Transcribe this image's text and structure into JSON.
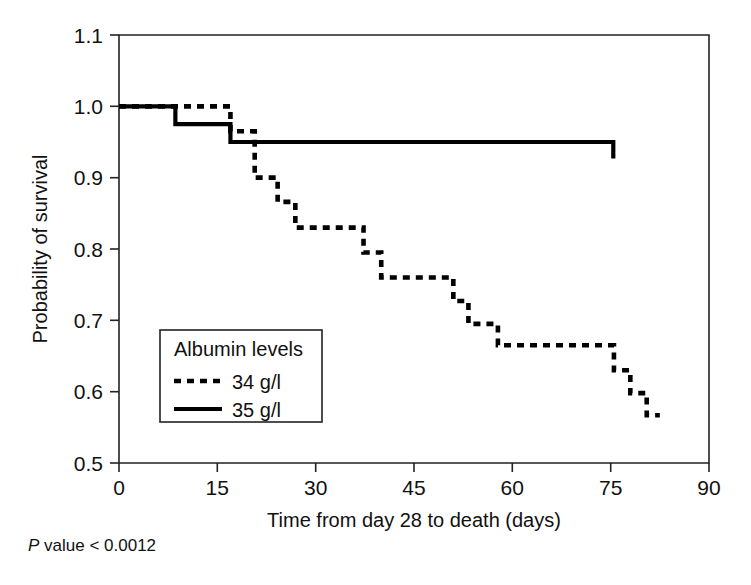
{
  "chart_data": {
    "type": "line",
    "title": "",
    "subtitle": "",
    "xlabel": "Time from day 28 to death (days)",
    "ylabel": "Probability of survival",
    "xlim": [
      0,
      90
    ],
    "ylim": [
      0.5,
      1.1
    ],
    "xticks": [
      0,
      15,
      30,
      45,
      60,
      75,
      90
    ],
    "xtick_labels": [
      "0",
      "15",
      "30",
      "45",
      "60",
      "75",
      "90"
    ],
    "yticks": [
      0.5,
      0.6,
      0.7,
      0.8,
      0.9,
      1.0,
      1.1
    ],
    "ytick_labels": [
      "0.5",
      "0.6",
      "0.7",
      "0.8",
      "0.9",
      "1.0",
      "1.1"
    ],
    "grid": false,
    "legend_position": "inner-left-lower",
    "legend_title": "Albumin levels",
    "annotation": "P value < 0.0012",
    "annotation_italic_prefix": "P",
    "annotation_rest": " value < 0.0012",
    "series": [
      {
        "name": "34 g/l",
        "style": "dashed",
        "color": "#000000",
        "points": [
          [
            0,
            1.0
          ],
          [
            8.6,
            1.0
          ],
          [
            17.0,
            1.0
          ],
          [
            17.0,
            0.965
          ],
          [
            20.7,
            0.965
          ],
          [
            20.7,
            0.9
          ],
          [
            24.2,
            0.9
          ],
          [
            24.2,
            0.866
          ],
          [
            26.9,
            0.866
          ],
          [
            26.9,
            0.83
          ],
          [
            37.3,
            0.83
          ],
          [
            37.3,
            0.795
          ],
          [
            40.0,
            0.795
          ],
          [
            40.0,
            0.76
          ],
          [
            51.0,
            0.76
          ],
          [
            51.0,
            0.727
          ],
          [
            53.3,
            0.727
          ],
          [
            53.3,
            0.695
          ],
          [
            57.8,
            0.695
          ],
          [
            57.8,
            0.665
          ],
          [
            75.5,
            0.665
          ],
          [
            75.5,
            0.63
          ],
          [
            78.0,
            0.63
          ],
          [
            78.0,
            0.598
          ],
          [
            80.5,
            0.598
          ],
          [
            80.5,
            0.567
          ],
          [
            82.5,
            0.567
          ]
        ]
      },
      {
        "name": "35 g/l",
        "style": "solid",
        "color": "#000000",
        "points": [
          [
            0,
            1.0
          ],
          [
            8.6,
            1.0
          ],
          [
            8.6,
            0.975
          ],
          [
            17.0,
            0.975
          ],
          [
            17.0,
            0.95
          ],
          [
            75.4,
            0.95
          ],
          [
            75.4,
            0.927
          ]
        ]
      }
    ]
  },
  "legend": {
    "title": "Albumin levels",
    "entries": [
      {
        "label": "34 g/l",
        "style": "dashed"
      },
      {
        "label": "35 g/l",
        "style": "solid"
      }
    ]
  },
  "axes": {
    "x_title": "Time from day 28 to death (days)",
    "y_title": "Probability of survival"
  },
  "footnote": {
    "italic_prefix": "P",
    "text": " value < 0.0012"
  }
}
